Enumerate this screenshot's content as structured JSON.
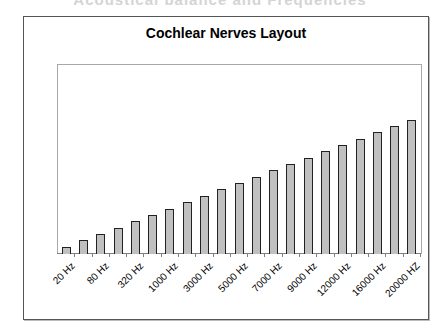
{
  "page": {
    "clipped_heading": "Acoustical balance and Frequencies"
  },
  "chart_data": {
    "type": "bar",
    "title": "Cochlear Nerves Layout",
    "xlabel": "",
    "ylabel": "",
    "categories": [
      "20 Hz",
      "",
      "80 Hz",
      "",
      "320 Hz",
      "",
      "1000 Hz",
      "",
      "3000 Hz",
      "",
      "5000 Hz",
      "",
      "7000 Hz",
      "",
      "9000 Hz",
      "",
      "12000 Hz",
      "",
      "16000 Hz",
      "",
      "20000 HZ"
    ],
    "visible_tick_labels": [
      "20 Hz",
      "80 Hz",
      "320 Hz",
      "1000 Hz",
      "3000 Hz",
      "5000 Hz",
      "7000 Hz",
      "9000 Hz",
      "12000 Hz",
      "16000 Hz",
      "20000 HZ"
    ],
    "values": [
      1,
      2,
      3,
      4,
      5,
      6,
      7,
      8,
      9,
      10,
      11,
      12,
      13,
      14,
      15,
      16,
      17,
      18,
      19,
      20,
      21
    ],
    "ylim": [
      0,
      25
    ],
    "grid": false,
    "legend": "none",
    "bar_color": "#c0c0c0",
    "bar_outline": "#222222"
  }
}
